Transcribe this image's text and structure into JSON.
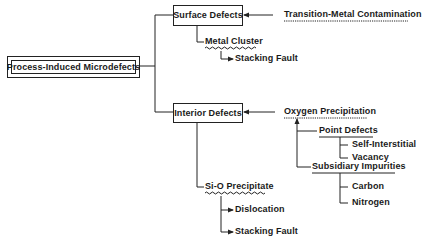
{
  "diagram": {
    "root": {
      "label": "Process-Induced Microdefects"
    },
    "branches": [
      {
        "label": "Surface Defects",
        "cause": "Transition-Metal Contamination",
        "children": [
          {
            "label": "Metal Cluster",
            "children": [
              {
                "label": "Stacking Fault"
              }
            ]
          }
        ]
      },
      {
        "label": "Interior Defects",
        "cause": "Oxygen Precipitation",
        "cause_children": [
          {
            "label": "Point Defects",
            "children": [
              {
                "label": "Self-Interstitial"
              },
              {
                "label": "Vacancy"
              }
            ]
          },
          {
            "label": "Subsidiary Impurities",
            "children": [
              {
                "label": "Carbon"
              },
              {
                "label": "Nitrogen"
              }
            ]
          }
        ],
        "children": [
          {
            "label": "Si-O Precipitate",
            "children": [
              {
                "label": "Dislocation"
              },
              {
                "label": "Stacking Fault"
              }
            ]
          }
        ]
      }
    ]
  }
}
